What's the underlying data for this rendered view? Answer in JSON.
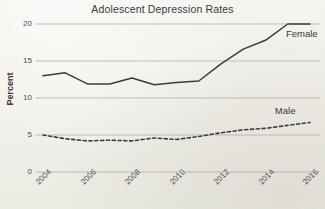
{
  "chart_data": {
    "type": "line",
    "title": "Adolescent Depression Rates",
    "xlabel": "",
    "ylabel": "Percent",
    "xlim": [
      2004,
      2016
    ],
    "ylim": [
      0,
      20
    ],
    "grid": true,
    "legend_position": "inline-right",
    "x": [
      2004,
      2005,
      2006,
      2007,
      2008,
      2009,
      2010,
      2011,
      2012,
      2013,
      2014,
      2015,
      2016
    ],
    "xticks": [
      "2004",
      "2006",
      "2008",
      "2010",
      "2012",
      "2014",
      "2016"
    ],
    "xtick_values": [
      2004,
      2006,
      2008,
      2010,
      2012,
      2014,
      2016
    ],
    "yticks": [
      "0",
      "5",
      "10",
      "15",
      "20"
    ],
    "ytick_values": [
      0,
      5,
      10,
      15,
      20
    ],
    "series": [
      {
        "name": "Female",
        "style": "solid",
        "color": "#3c3c3c",
        "values": [
          13.0,
          13.4,
          11.9,
          11.9,
          12.7,
          11.8,
          12.1,
          12.3,
          14.6,
          16.6,
          17.8,
          20.0,
          20.0
        ]
      },
      {
        "name": "Male",
        "style": "dashed",
        "color": "#3c3c3c",
        "values": [
          5.0,
          4.5,
          4.2,
          4.3,
          4.2,
          4.6,
          4.4,
          4.8,
          5.3,
          5.7,
          5.9,
          6.3,
          6.7
        ]
      }
    ],
    "annotations": [
      {
        "text": "Female",
        "x": 2015.1,
        "y": 18.6
      },
      {
        "text": "Male",
        "x": 2014.6,
        "y": 8.2
      }
    ]
  },
  "colors": {
    "background": "#f3f1ec",
    "ink": "#3c3c3c",
    "grid": "#a8a49c",
    "text": "#3a3a3a"
  }
}
